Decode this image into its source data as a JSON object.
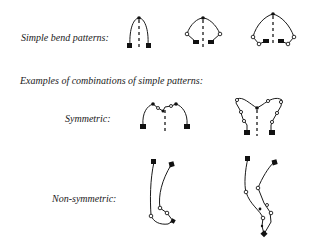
{
  "figure": {
    "labels": {
      "simple": "Simple bend patterns:",
      "combinations": "Examples of combinations of simple patterns:",
      "symmetric": "Symmetric:",
      "non_symmetric": "Non-symmetric:"
    },
    "legend_symbols": {
      "filled_square": "end point",
      "open_circle": "bend point",
      "filled_dot": "apex",
      "dashed_line": "axis of symmetry"
    },
    "rows": [
      {
        "name": "simple-bend-patterns",
        "count": 3
      },
      {
        "name": "symmetric-combinations",
        "count": 2
      },
      {
        "name": "non-symmetric-combinations",
        "count": 2
      }
    ],
    "colors": {
      "ink": "#1a1a1a",
      "background": "#ffffff"
    }
  }
}
